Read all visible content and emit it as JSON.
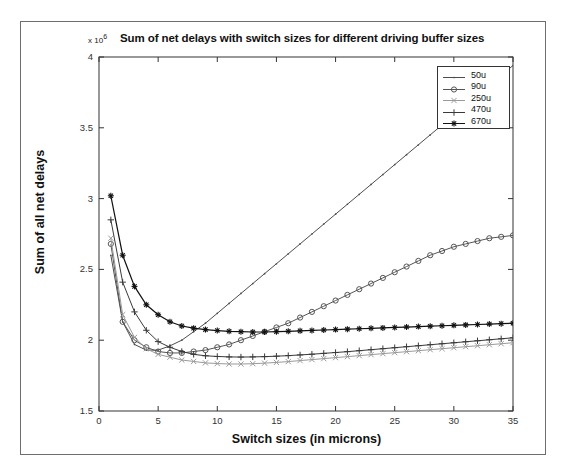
{
  "figure": {
    "title": "Sum of net delays with switch sizes for different driving buffer sizes",
    "exponent_prefix": "x 10",
    "exponent_power": "6",
    "xlabel": "Switch sizes (in microns)",
    "ylabel": "Sum of all net delays"
  },
  "axes": {
    "x_ticks": [
      "0",
      "5",
      "10",
      "15",
      "20",
      "25",
      "30",
      "35"
    ],
    "y_ticks": [
      "1.5",
      "2",
      "2.5",
      "3",
      "3.5",
      "4"
    ]
  },
  "legend": {
    "entries": [
      {
        "label": "50u",
        "marker": "point-marker",
        "color": "#4d4d4d"
      },
      {
        "label": "90u",
        "marker": "circle-marker",
        "color": "#555555"
      },
      {
        "label": "250u",
        "marker": "x-marker",
        "color": "#9a9a9a"
      },
      {
        "label": "470u",
        "marker": "plus-marker",
        "color": "#3a3a3a"
      },
      {
        "label": "670u",
        "marker": "asterisk-marker",
        "color": "#111111"
      }
    ]
  },
  "chart_data": {
    "type": "line",
    "title": "Sum of net delays with switch sizes for different driving buffer sizes",
    "xlabel": "Switch sizes (in microns)",
    "ylabel": "Sum of all net delays",
    "y_scale_factor": 1000000,
    "y_scale_label": "x 10^6",
    "xlim": [
      0,
      35
    ],
    "ylim": [
      1.5,
      4
    ],
    "xticks": [
      0,
      5,
      10,
      15,
      20,
      25,
      30,
      35
    ],
    "yticks": [
      1.5,
      2,
      2.5,
      3,
      3.5,
      4
    ],
    "grid": false,
    "legend_position": "top-right",
    "x": [
      1,
      2,
      3,
      4,
      5,
      6,
      7,
      8,
      9,
      10,
      11,
      12,
      13,
      14,
      15,
      16,
      17,
      18,
      19,
      20,
      21,
      22,
      23,
      24,
      25,
      26,
      27,
      28,
      29,
      30,
      31,
      32,
      33,
      34,
      35
    ],
    "series": [
      {
        "name": "50u",
        "marker": "point",
        "color": "#4d4d4d",
        "values": [
          2.6,
          2.13,
          1.97,
          1.93,
          1.93,
          1.96,
          2.0,
          2.06,
          2.12,
          2.19,
          2.26,
          2.33,
          2.4,
          2.47,
          2.54,
          2.61,
          2.68,
          2.75,
          2.82,
          2.89,
          2.96,
          3.03,
          3.1,
          3.17,
          3.24,
          3.31,
          3.38,
          3.45,
          3.52,
          3.59,
          3.66,
          3.73,
          3.8,
          3.87,
          3.94
        ]
      },
      {
        "name": "90u",
        "marker": "circle",
        "color": "#555555",
        "values": [
          2.68,
          2.13,
          2.0,
          1.95,
          1.92,
          1.91,
          1.91,
          1.92,
          1.93,
          1.95,
          1.97,
          2.0,
          2.03,
          2.06,
          2.09,
          2.12,
          2.16,
          2.2,
          2.24,
          2.28,
          2.32,
          2.36,
          2.4,
          2.44,
          2.48,
          2.52,
          2.56,
          2.6,
          2.63,
          2.66,
          2.68,
          2.7,
          2.72,
          2.73,
          2.74
        ]
      },
      {
        "name": "250u",
        "marker": "x",
        "color": "#9a9a9a",
        "values": [
          2.72,
          2.18,
          2.02,
          1.94,
          1.9,
          1.88,
          1.86,
          1.85,
          1.84,
          1.835,
          1.832,
          1.832,
          1.834,
          1.838,
          1.843,
          1.849,
          1.856,
          1.863,
          1.87,
          1.877,
          1.884,
          1.891,
          1.898,
          1.905,
          1.912,
          1.919,
          1.926,
          1.933,
          1.94,
          1.947,
          1.954,
          1.961,
          1.968,
          1.975,
          1.982
        ]
      },
      {
        "name": "470u",
        "marker": "plus",
        "color": "#3a3a3a",
        "values": [
          2.85,
          2.41,
          2.2,
          2.07,
          1.99,
          1.95,
          1.92,
          1.9,
          1.89,
          1.885,
          1.882,
          1.881,
          1.882,
          1.884,
          1.887,
          1.891,
          1.896,
          1.901,
          1.907,
          1.913,
          1.919,
          1.926,
          1.933,
          1.94,
          1.947,
          1.954,
          1.961,
          1.968,
          1.975,
          1.982,
          1.989,
          1.996,
          2.003,
          2.01,
          2.017
        ]
      },
      {
        "name": "670u",
        "marker": "asterisk",
        "color": "#111111",
        "values": [
          3.02,
          2.6,
          2.38,
          2.25,
          2.18,
          2.13,
          2.1,
          2.085,
          2.075,
          2.068,
          2.063,
          2.06,
          2.058,
          2.058,
          2.06,
          2.063,
          2.066,
          2.069,
          2.072,
          2.075,
          2.078,
          2.081,
          2.084,
          2.087,
          2.09,
          2.093,
          2.096,
          2.099,
          2.102,
          2.105,
          2.108,
          2.111,
          2.114,
          2.117,
          2.12
        ]
      }
    ]
  }
}
